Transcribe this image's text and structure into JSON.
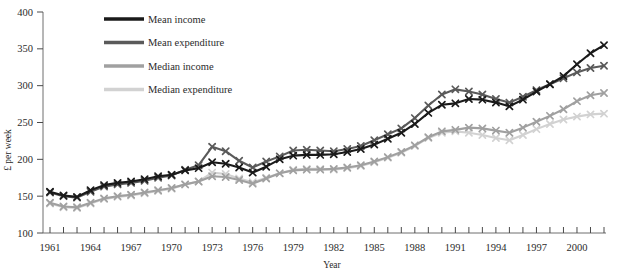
{
  "chart_data": {
    "type": "line",
    "title": "",
    "xlabel": "Year",
    "ylabel": "£ per week",
    "xlim": [
      1961,
      2002
    ],
    "ylim": [
      100,
      400
    ],
    "ytick_labels": [
      "100",
      "150",
      "200",
      "250",
      "300",
      "350",
      "400"
    ],
    "yticks": [
      100,
      150,
      200,
      250,
      300,
      350,
      400
    ],
    "xtick_labels": [
      "1961",
      "1964",
      "1967",
      "1970",
      "1973",
      "1976",
      "1979",
      "1982",
      "1985",
      "1988",
      "1991",
      "1994",
      "1997",
      "2000"
    ],
    "xticks": [
      1961,
      1964,
      1967,
      1970,
      1973,
      1976,
      1979,
      1982,
      1985,
      1988,
      1991,
      1994,
      1997,
      2000
    ],
    "x": [
      1961,
      1962,
      1963,
      1964,
      1965,
      1966,
      1967,
      1968,
      1969,
      1970,
      1971,
      1972,
      1973,
      1974,
      1975,
      1976,
      1977,
      1978,
      1979,
      1980,
      1981,
      1982,
      1983,
      1984,
      1985,
      1986,
      1987,
      1988,
      1989,
      1990,
      1991,
      1992,
      1993,
      1994,
      1995,
      1996,
      1997,
      1998,
      1999,
      2000,
      2001,
      2002
    ],
    "grid": false,
    "marker": "x",
    "legend_position": "top-left",
    "series": [
      {
        "name": "Mean income",
        "color": "#1a1a1a",
        "values": [
          156,
          151,
          149,
          158,
          165,
          168,
          170,
          173,
          177,
          179,
          185,
          188,
          196,
          194,
          189,
          182,
          190,
          200,
          205,
          206,
          206,
          207,
          210,
          214,
          220,
          228,
          236,
          248,
          263,
          274,
          276,
          282,
          281,
          277,
          272,
          281,
          292,
          302,
          313,
          329,
          344,
          355
        ]
      },
      {
        "name": "Mean expenditure",
        "color": "#5a5a5a",
        "values": [
          155,
          150,
          148,
          156,
          163,
          166,
          168,
          171,
          175,
          178,
          186,
          192,
          217,
          211,
          198,
          189,
          197,
          204,
          212,
          213,
          212,
          211,
          214,
          218,
          226,
          234,
          242,
          256,
          273,
          288,
          295,
          292,
          288,
          282,
          277,
          285,
          294,
          302,
          310,
          318,
          324,
          327
        ]
      },
      {
        "name": "Median income",
        "color": "#a0a0a0",
        "values": [
          141,
          136,
          135,
          141,
          147,
          150,
          152,
          155,
          158,
          161,
          166,
          170,
          177,
          176,
          172,
          167,
          174,
          181,
          185,
          186,
          186,
          187,
          189,
          192,
          197,
          203,
          210,
          219,
          230,
          238,
          240,
          243,
          242,
          239,
          236,
          243,
          251,
          259,
          268,
          279,
          287,
          290
        ]
      },
      {
        "name": "Median expenditure",
        "color": "#d2d2d2",
        "values": [
          140,
          135,
          134,
          140,
          146,
          149,
          151,
          154,
          157,
          160,
          166,
          170,
          182,
          180,
          174,
          169,
          175,
          181,
          186,
          187,
          187,
          186,
          188,
          191,
          196,
          202,
          209,
          218,
          229,
          236,
          238,
          236,
          233,
          229,
          226,
          233,
          241,
          248,
          254,
          258,
          261,
          262
        ]
      }
    ]
  },
  "legend": {
    "items": [
      {
        "label": "Mean income",
        "color": "#1a1a1a"
      },
      {
        "label": "Mean expenditure",
        "color": "#5a5a5a"
      },
      {
        "label": "Median income",
        "color": "#a0a0a0"
      },
      {
        "label": "Median expenditure",
        "color": "#d2d2d2"
      }
    ]
  }
}
